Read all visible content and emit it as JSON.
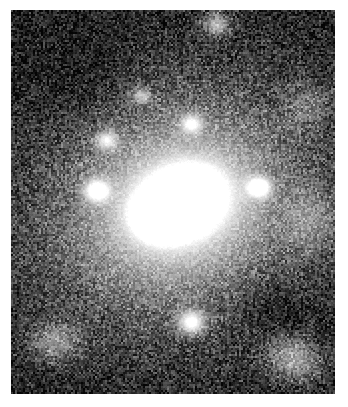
{
  "figure": {
    "kind": "astronomical-image",
    "colormap": "grayscale",
    "background_color": "#ffffff",
    "sky_color": "#000000",
    "peak_color": "#ffffff",
    "caption": "",
    "title": "",
    "labels": []
  },
  "frame": {
    "left": 11,
    "top": 10,
    "width": 324,
    "height": 384,
    "border_color": "#ffffff"
  },
  "chart_data": {
    "type": "heatmap",
    "title": "",
    "xlabel": "",
    "ylabel": "",
    "grid": false,
    "legend": "none",
    "colormap": "gray",
    "value_range": [
      0,
      255
    ],
    "pixel_width": 324,
    "pixel_height": 384,
    "noise": {
      "model": "poisson-like-speckle",
      "amplitude": 58,
      "grain_size_px": 2,
      "floor": 4
    },
    "background_level": 12,
    "sources": [
      {
        "name": "galaxy-nucleus",
        "cx": 170,
        "cy": 192,
        "amplitude": 252,
        "sigma_x": 26,
        "sigma_y": 19,
        "angle_deg": -22,
        "kind": "core"
      },
      {
        "name": "galaxy-nucleus-peak",
        "cx": 176,
        "cy": 185,
        "amplitude": 255,
        "sigma_x": 12,
        "sigma_y": 9,
        "angle_deg": -25,
        "kind": "core"
      },
      {
        "name": "galaxy-inner-knot",
        "cx": 148,
        "cy": 206,
        "amplitude": 235,
        "sigma_x": 14,
        "sigma_y": 12,
        "angle_deg": 0,
        "kind": "core"
      },
      {
        "name": "galaxy-halo-inner",
        "cx": 168,
        "cy": 195,
        "amplitude": 150,
        "sigma_x": 58,
        "sigma_y": 48,
        "angle_deg": -20,
        "kind": "halo"
      },
      {
        "name": "galaxy-halo-outer",
        "cx": 167,
        "cy": 196,
        "amplitude": 78,
        "sigma_x": 104,
        "sigma_y": 88,
        "angle_deg": -18,
        "kind": "halo"
      },
      {
        "name": "galaxy-halo-extended",
        "cx": 166,
        "cy": 198,
        "amplitude": 36,
        "sigma_x": 150,
        "sigma_y": 128,
        "angle_deg": -15,
        "kind": "halo"
      },
      {
        "name": "star-west",
        "cx": 85,
        "cy": 180,
        "amplitude": 178,
        "sigma_x": 9,
        "sigma_y": 8,
        "angle_deg": 0,
        "kind": "point"
      },
      {
        "name": "star-east",
        "cx": 248,
        "cy": 177,
        "amplitude": 196,
        "sigma_x": 8,
        "sigma_y": 7,
        "angle_deg": 0,
        "kind": "point"
      },
      {
        "name": "star-south",
        "cx": 180,
        "cy": 312,
        "amplitude": 200,
        "sigma_x": 10,
        "sigma_y": 9,
        "angle_deg": 0,
        "kind": "point"
      },
      {
        "name": "star-northwest",
        "cx": 95,
        "cy": 130,
        "amplitude": 150,
        "sigma_x": 8,
        "sigma_y": 7,
        "angle_deg": 0,
        "kind": "point"
      },
      {
        "name": "star-north",
        "cx": 180,
        "cy": 113,
        "amplitude": 146,
        "sigma_x": 8,
        "sigma_y": 7,
        "angle_deg": 0,
        "kind": "point"
      },
      {
        "name": "star-north-faint",
        "cx": 130,
        "cy": 85,
        "amplitude": 118,
        "sigma_x": 7,
        "sigma_y": 6,
        "angle_deg": 0,
        "kind": "point"
      },
      {
        "name": "star-top",
        "cx": 205,
        "cy": 14,
        "amplitude": 150,
        "sigma_x": 9,
        "sigma_y": 8,
        "angle_deg": 0,
        "kind": "point"
      },
      {
        "name": "patch-southeast",
        "cx": 283,
        "cy": 348,
        "amplitude": 132,
        "sigma_x": 20,
        "sigma_y": 16,
        "angle_deg": 20,
        "kind": "diffuse"
      },
      {
        "name": "patch-southwest",
        "cx": 44,
        "cy": 332,
        "amplitude": 104,
        "sigma_x": 16,
        "sigma_y": 13,
        "angle_deg": 0,
        "kind": "diffuse"
      },
      {
        "name": "patch-east",
        "cx": 300,
        "cy": 210,
        "amplitude": 70,
        "sigma_x": 18,
        "sigma_y": 22,
        "angle_deg": 0,
        "kind": "diffuse"
      },
      {
        "name": "patch-northeast",
        "cx": 296,
        "cy": 95,
        "amplitude": 60,
        "sigma_x": 16,
        "sigma_y": 16,
        "angle_deg": 0,
        "kind": "diffuse"
      }
    ],
    "dark_lanes": [
      {
        "name": "lane-southeast",
        "cx": 262,
        "cy": 300,
        "amplitude": 34,
        "sigma_x": 34,
        "sigma_y": 22,
        "angle_deg": 40
      },
      {
        "name": "lane-northwest",
        "cx": 70,
        "cy": 70,
        "amplitude": 22,
        "sigma_x": 40,
        "sigma_y": 28,
        "angle_deg": -30
      }
    ]
  }
}
